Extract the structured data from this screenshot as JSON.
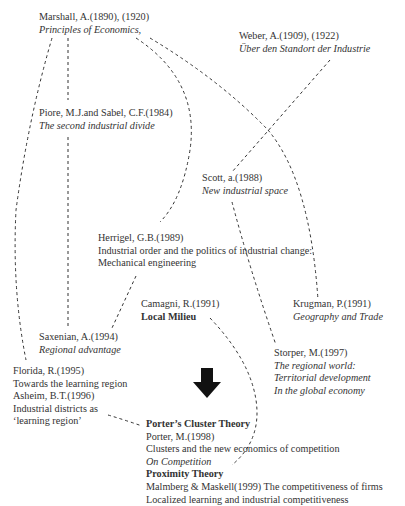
{
  "diagram": {
    "type": "citation-lineage",
    "nodes": {
      "marshall": {
        "author": "Marshall, A.(1890), (1920)",
        "title": "Principles of Economics,"
      },
      "weber": {
        "author": "Weber, A.(1909), (1922)",
        "title": "Über den Standort der Industrie"
      },
      "piore": {
        "author": "Piore, M.J.and Sabel, C.F.(1984)",
        "title": "The second industrial divide"
      },
      "scott": {
        "author": "Scott, a.(1988)",
        "title": "New industrial space"
      },
      "herrigel": {
        "author": "Herrigel, G.B.(1989)",
        "title_line1": "Industrial order and the politics of industrial change:",
        "title_line2": "Mechanical engineering"
      },
      "camagni": {
        "author": "Camagni, R.(1991)",
        "title": "Local Milieu"
      },
      "krugman": {
        "author": "Krugman, P.(1991)",
        "title": "Geography and Trade"
      },
      "saxenian": {
        "author": "Saxenian, A.(1994)",
        "title": "Regional advantage"
      },
      "storper": {
        "author": "Storper, M.(1997)",
        "title_line1": "The regional world:",
        "title_line2": "Territorial development",
        "title_line3": "In the global economy"
      },
      "florida_asheim": {
        "florida_author": "Florida, R.(1995)",
        "florida_title": "Towards the learning region",
        "asheim_author": "Asheim, B.T.(1996)",
        "asheim_title_line1": "Industrial districts as",
        "asheim_title_line2": "‘learning region’"
      },
      "porter_proximity": {
        "porter_heading": "Porter’s Cluster Theory",
        "porter_author": "Porter, M.(1998)",
        "porter_title": "Clusters and the new economics of competition",
        "porter_book": "On Competition",
        "proximity_heading": "Proximity Theory",
        "malmberg": "Malmberg & Maskell(1999) The competitiveness of firms",
        "localized": "Localized learning and industrial competitiveness"
      }
    },
    "edges": [
      [
        "marshall",
        "piore"
      ],
      [
        "marshall",
        "florida_asheim"
      ],
      [
        "marshall",
        "herrigel"
      ],
      [
        "marshall",
        "krugman"
      ],
      [
        "weber",
        "scott"
      ],
      [
        "piore",
        "saxenian"
      ],
      [
        "scott",
        "storper"
      ],
      [
        "herrigel",
        "saxenian"
      ],
      [
        "camagni",
        "porter_proximity"
      ],
      [
        "florida_asheim",
        "porter_proximity"
      ]
    ],
    "arrow": {
      "icon": "down-arrow-icon",
      "color": "#111111"
    }
  }
}
